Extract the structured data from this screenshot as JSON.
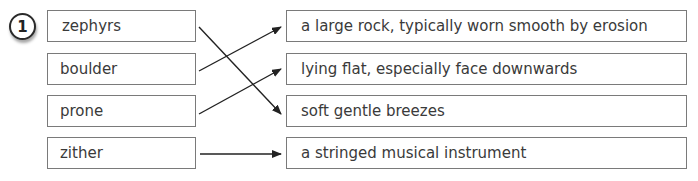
{
  "exercise": {
    "number": "1",
    "words": [
      "zephyrs",
      "boulder",
      "prone",
      "zither"
    ],
    "definitions": [
      "a large rock, typically worn smooth by erosion",
      "lying flat, especially face downwards",
      "soft gentle breezes",
      "a stringed musical instrument"
    ],
    "matches": [
      {
        "word": "zephyrs",
        "definition": "soft gentle breezes"
      },
      {
        "word": "boulder",
        "definition": "a large rock, typically worn smooth by erosion"
      },
      {
        "word": "prone",
        "definition": "lying flat, especially face downwards"
      },
      {
        "word": "zither",
        "definition": "a stringed musical instrument"
      }
    ]
  }
}
